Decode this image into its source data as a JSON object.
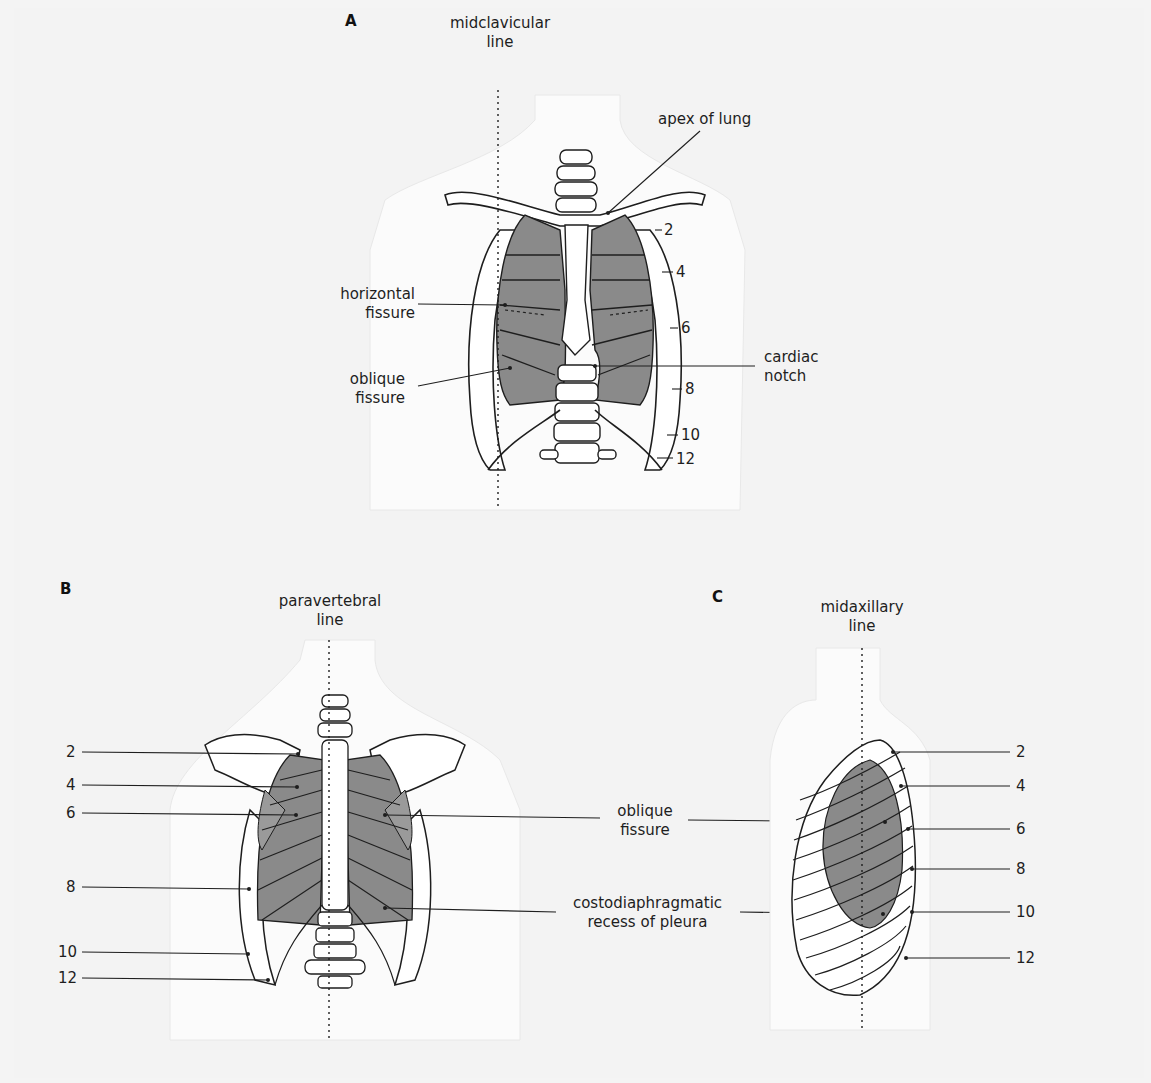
{
  "figure": {
    "colors": {
      "background": "#f3f3f3",
      "body_silhouette": "#fbfbfb",
      "lung_fill": "#8a8a8a",
      "bone_fill": "#ffffff",
      "outline": "#1e1e1e"
    }
  },
  "panelA": {
    "letter": "A",
    "view": "anterior",
    "reference_line": {
      "line1": "midclavicular",
      "line2": "line"
    },
    "labels": {
      "apex": "apex of lung",
      "horizontal_1": "horizontal",
      "horizontal_2": "fissure",
      "oblique_1": "oblique",
      "oblique_2": "fissure",
      "cardiac_1": "cardiac",
      "cardiac_2": "notch"
    },
    "ribs": [
      "2",
      "4",
      "6",
      "8",
      "10",
      "12"
    ]
  },
  "panelB": {
    "letter": "B",
    "view": "posterior",
    "reference_line": {
      "line1": "paravertebral",
      "line2": "line"
    },
    "labels": {
      "oblique_1": "oblique",
      "oblique_2": "fissure",
      "recess_1": "costodiaphragmatic",
      "recess_2": "recess of pleura"
    },
    "ribs": [
      "2",
      "4",
      "6",
      "8",
      "10",
      "12"
    ]
  },
  "panelC": {
    "letter": "C",
    "view": "lateral",
    "reference_line": {
      "line1": "midaxillary",
      "line2": "line"
    },
    "ribs": [
      "2",
      "4",
      "6",
      "8",
      "10",
      "12"
    ]
  }
}
